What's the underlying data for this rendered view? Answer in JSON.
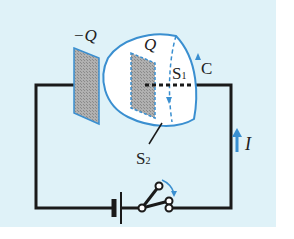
{
  "diagram": {
    "type": "circuit",
    "labels": {
      "neg_plate": "−Q",
      "pos_plate": "Q",
      "surface1": "S",
      "surface1_sub": "1",
      "surface2": "S",
      "surface2_sub": "2",
      "curve": "C",
      "current": "I"
    },
    "colors": {
      "background": "#dff2f8",
      "wire": "#1a1a1a",
      "accent": "#3a8fd0",
      "plate_fill": "#a8a8a8"
    }
  }
}
